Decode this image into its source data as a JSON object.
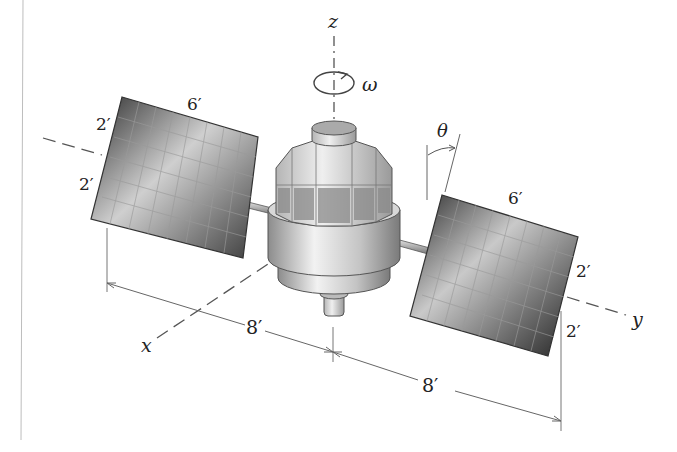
{
  "figure": {
    "axes": {
      "x": "x",
      "y": "y",
      "z": "z"
    },
    "rotation_symbol": "ω",
    "angle_symbol": "θ",
    "left_panel": {
      "length_label": "6′",
      "upper_half_label": "2′",
      "lower_half_label": "2′"
    },
    "right_panel": {
      "length_label": "6′",
      "upper_half_label": "2′",
      "lower_half_label": "2′"
    },
    "dimensions": {
      "left_span_label": "8′",
      "right_span_label": "8′"
    }
  },
  "colors": {
    "line": "#555555",
    "panel_dark": "#3a3a3a",
    "panel_light": "#d8d8d8",
    "body_light": "#e6e6e6",
    "body_mid": "#a8a8a8",
    "border_line": "#bbbbbb"
  }
}
